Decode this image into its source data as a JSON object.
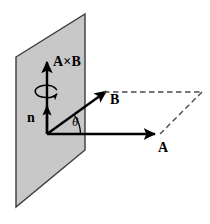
{
  "figure": {
    "type": "vector-cross-product-diagram",
    "background_color": "#ffffff",
    "stroke_color": "#000000",
    "plane_fill_color": "#c8c8c8",
    "plane_edge_color": "#333333"
  },
  "labels": {
    "cross_product": "A×B",
    "normal": "n",
    "vector_b": "B",
    "vector_a": "A",
    "angle": "θ"
  },
  "geometry": {
    "origin": {
      "x": 47,
      "y": 134
    },
    "plane_polygon": "16,57 85,14 85,150 16,207",
    "vector_cross_product": {
      "x1": 47,
      "y1": 134,
      "x2": 47,
      "y2": 58
    },
    "vector_normal": {
      "x1": 47,
      "y1": 134,
      "x2": 47,
      "y2": 101
    },
    "vector_a": {
      "x1": 47,
      "y1": 134,
      "x2": 160,
      "y2": 134
    },
    "vector_b": {
      "x1": 47,
      "y1": 134,
      "x2": 104,
      "y2": 93
    },
    "dashed_parallelogram": [
      {
        "x1": 104,
        "y1": 92,
        "x2": 202,
        "y2": 92
      },
      {
        "x1": 202,
        "y1": 92,
        "x2": 160,
        "y2": 134
      }
    ],
    "angle_arc": {
      "cx": 47,
      "cy": 134,
      "radius": 32,
      "start_deg": 0,
      "end_deg": 36
    },
    "rotation_ellipse": {
      "cx": 47,
      "cy": 93,
      "rx": 11,
      "ry": 5.5
    }
  },
  "icon_names": {
    "plane": "shaded-plane-icon",
    "arrowhead": "arrowhead-icon",
    "rotation": "rotation-curl-icon"
  }
}
